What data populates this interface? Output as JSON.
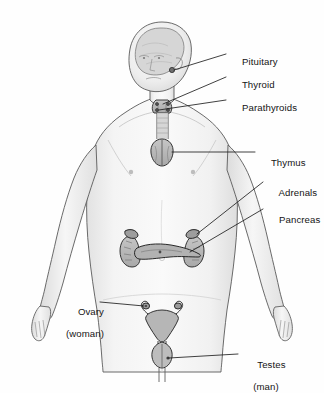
{
  "figure": {
    "palette": {
      "background": "#ffffff",
      "body_fill": "#f2f2f2",
      "body_shade": "#dcdcdc",
      "body_outline": "#4a4a4a",
      "organ_fill": "#b9b9b9",
      "organ_outline": "#2b2b2b",
      "brain_fill": "#d3d3d3",
      "leader_line": "#1f1f1f",
      "label_text": "#141414"
    }
  },
  "labels": [
    {
      "id": "pituitary",
      "text": "Pituitary",
      "sub": "",
      "x": 231,
      "y": 50,
      "align": "left"
    },
    {
      "id": "thyroid",
      "text": "Thyroid",
      "sub": "",
      "x": 231,
      "y": 73,
      "align": "left"
    },
    {
      "id": "parathyroids",
      "text": "Parathyroids",
      "sub": "",
      "x": 231,
      "y": 96,
      "align": "left"
    },
    {
      "id": "thymus",
      "text": "Thymus",
      "sub": "",
      "x": 260,
      "y": 148,
      "align": "left"
    },
    {
      "id": "adrenals",
      "text": "Adrenals",
      "sub": "",
      "x": 268,
      "y": 178,
      "align": "left"
    },
    {
      "id": "pancreas",
      "text": "Pancreas",
      "sub": "",
      "x": 268,
      "y": 205,
      "align": "left"
    },
    {
      "id": "ovary",
      "text": "Ovary",
      "sub": "(woman)",
      "x": 64,
      "y": 297,
      "align": "left"
    },
    {
      "id": "testes",
      "text": "Testes",
      "sub": "(man)",
      "x": 243,
      "y": 350,
      "align": "left"
    }
  ],
  "glands": [
    {
      "id": "pituitary-gland",
      "name": "pituitary",
      "region": "brain-base"
    },
    {
      "id": "thyroid-gland",
      "name": "thyroid",
      "region": "neck"
    },
    {
      "id": "parathyroid-glands",
      "name": "parathyroids",
      "region": "neck-posterior"
    },
    {
      "id": "thymus-gland",
      "name": "thymus",
      "region": "upper-chest"
    },
    {
      "id": "adrenal-glands",
      "name": "adrenals",
      "region": "atop-kidneys"
    },
    {
      "id": "pancreas-gland",
      "name": "pancreas",
      "region": "abdomen"
    },
    {
      "id": "ovaries",
      "name": "ovary",
      "region": "pelvis-female"
    },
    {
      "id": "testes",
      "name": "testes",
      "region": "pelvis-male"
    }
  ]
}
